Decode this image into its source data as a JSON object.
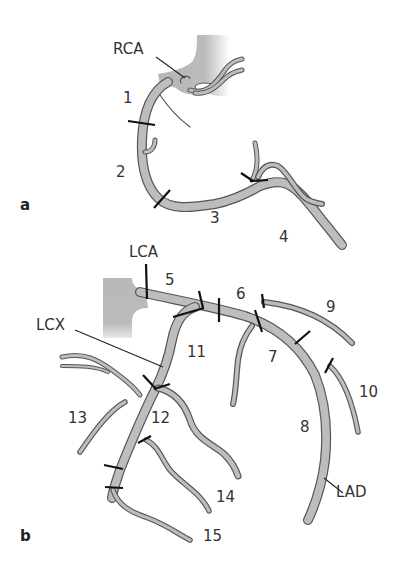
{
  "panels": {
    "a": {
      "label": "a"
    },
    "b": {
      "label": "b"
    }
  },
  "vessels": {
    "rca": "RCA",
    "lca": "LCA",
    "lcx": "LCX",
    "lad": "LAD"
  },
  "segments": {
    "s1": "1",
    "s2": "2",
    "s3": "3",
    "s4": "4",
    "s5": "5",
    "s6": "6",
    "s7": "7",
    "s8": "8",
    "s9": "9",
    "s10": "10",
    "s11": "11",
    "s12": "12",
    "s13": "13",
    "s14": "14",
    "s15": "15"
  },
  "colors": {
    "vessel_fill": "#bdbdbd",
    "vessel_outline": "#555555",
    "aorta_fill": "#b8b8b8",
    "tick": "#111111",
    "text": "#333333"
  }
}
